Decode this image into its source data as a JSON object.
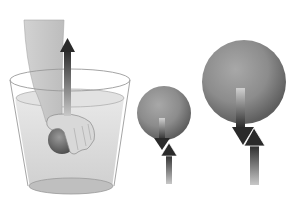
{
  "figure": {
    "panels": [
      {
        "id": "bucket",
        "label": "hand pushing ball into water",
        "arrow": "up"
      },
      {
        "id": "small-sphere",
        "label": "small sphere",
        "arrows": [
          "down-weight",
          "up-buoyancy"
        ]
      },
      {
        "id": "large-sphere",
        "label": "large sphere",
        "arrows": [
          "down-weight",
          "up-buoyancy"
        ]
      }
    ],
    "colors": {
      "background": "#ffffff",
      "water": "#d9d9d9",
      "bucket_outline": "#9a9a9a",
      "arm": "#c8c8c8",
      "sphere": "#8a8a8a",
      "arrow_dark": "#2a2a2a",
      "arrow_light": "#bdbdbd"
    }
  }
}
